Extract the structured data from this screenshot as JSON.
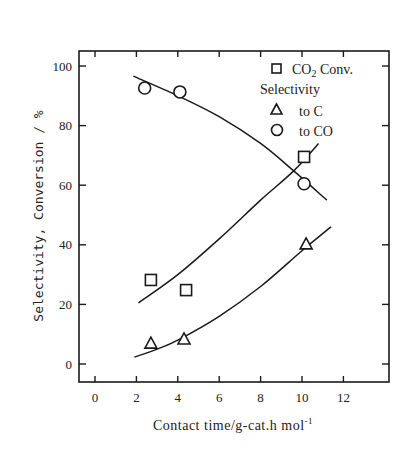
{
  "chart_data": {
    "type": "scatter",
    "title": "",
    "xlabel": "Contact time/g-cat.h mol",
    "xlabel_superscript": "-1",
    "ylabel": "Selectivity, Conversion / %",
    "xlim": [
      0,
      14
    ],
    "ylim": [
      -5,
      105
    ],
    "xticks": [
      0,
      2,
      4,
      6,
      8,
      10,
      12
    ],
    "yticks": [
      0,
      20,
      40,
      60,
      80,
      100
    ],
    "grid": false,
    "legend_position": "upper right",
    "legend": {
      "entries": [
        {
          "marker": "square",
          "label": "CO",
          "subscript": "2",
          "suffix": " Conv."
        },
        {
          "heading": "Selectivity"
        },
        {
          "marker": "triangle",
          "label": "to C"
        },
        {
          "marker": "circle",
          "label": "to CO"
        }
      ]
    },
    "series": [
      {
        "name": "CO2 Conv.",
        "marker": "square",
        "x": [
          2.7,
          4.4,
          10.1
        ],
        "y": [
          28.2,
          24.8,
          69.5
        ],
        "fit_curve": {
          "x": [
            2.1,
            4,
            6,
            8,
            9.6,
            10.8
          ],
          "y": [
            20.5,
            30,
            42,
            55,
            64.8,
            74
          ]
        }
      },
      {
        "name": "Selectivity to C",
        "marker": "triangle",
        "x": [
          2.7,
          4.3,
          10.2
        ],
        "y": [
          7.0,
          8.4,
          40.3
        ],
        "fit_curve": {
          "x": [
            1.9,
            3,
            4,
            6,
            8,
            10,
            11.4
          ],
          "y": [
            2.3,
            5,
            8,
            16,
            26,
            38,
            46
          ]
        }
      },
      {
        "name": "Selectivity to CO",
        "marker": "circle",
        "x": [
          2.4,
          4.1,
          10.1
        ],
        "y": [
          92.6,
          91.3,
          60.5
        ],
        "fit_curve": {
          "x": [
            1.85,
            4,
            6,
            8,
            9.6,
            11.2
          ],
          "y": [
            96.6,
            90,
            83,
            74,
            64.8,
            55
          ]
        }
      }
    ]
  }
}
